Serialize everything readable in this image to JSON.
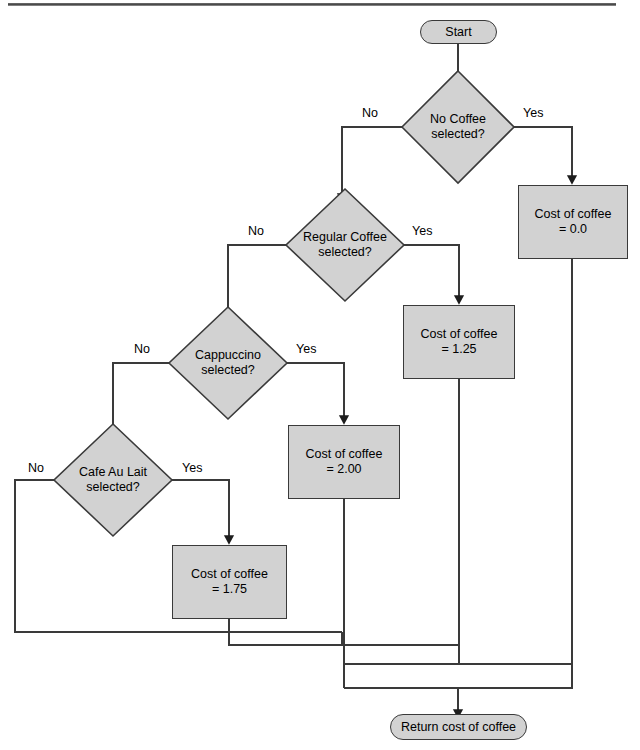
{
  "page": {
    "background": "#ffffff",
    "rule_color": "#4a4a4a",
    "shape_fill": "#d2d2d2",
    "shape_stroke": "#3a3a3a",
    "line_color": "#3a3a3a",
    "text_color": "#000000"
  },
  "nodes": {
    "start": {
      "label": "Start",
      "type": "terminal"
    },
    "d1": {
      "line1": "No Coffee",
      "line2": "selected?",
      "type": "decision"
    },
    "d2": {
      "line1": "Regular Coffee",
      "line2": "selected?",
      "type": "decision"
    },
    "d3": {
      "line1": "Cappuccino",
      "line2": "selected?",
      "type": "decision"
    },
    "d4": {
      "line1": "Cafe Au Lait",
      "line2": "selected?",
      "type": "decision"
    },
    "p1": {
      "line1": "Cost of coffee",
      "line2": "= 0.0",
      "type": "process"
    },
    "p2": {
      "line1": "Cost of coffee",
      "line2": "= 1.25",
      "type": "process"
    },
    "p3": {
      "line1": "Cost of coffee",
      "line2": "= 2.00",
      "type": "process"
    },
    "p4": {
      "line1": "Cost of coffee",
      "line2": "= 1.75",
      "type": "process"
    },
    "end": {
      "label": "Return cost of coffee",
      "type": "terminal"
    }
  },
  "edge_labels": {
    "d1_no": "No",
    "d1_yes": "Yes",
    "d2_no": "No",
    "d2_yes": "Yes",
    "d3_no": "No",
    "d3_yes": "Yes",
    "d4_no": "No",
    "d4_yes": "Yes"
  }
}
